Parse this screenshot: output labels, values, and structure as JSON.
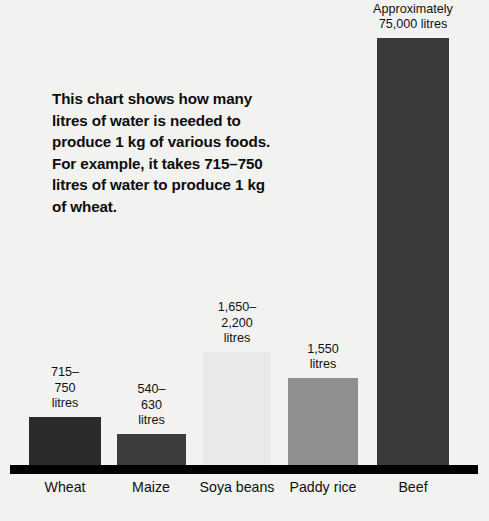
{
  "figure": {
    "background_color": "#f2f2f0",
    "axis_color": "#000000",
    "text_color": "#111111"
  },
  "caption": {
    "text": "This chart shows how many\nlitres of water is needed to\nproduce 1 kg of various foods.\nFor example, it takes 715–750\nlitres of water to produce 1 kg\nof wheat."
  },
  "chart_data": {
    "type": "bar",
    "title": "",
    "subtitle": "",
    "xlabel": "",
    "ylabel": "",
    "ylim": [
      0,
      75000
    ],
    "grid": false,
    "legend": "none",
    "units": "litres of water per 1 kg of food",
    "categories": [
      "Wheat",
      "Maize",
      "Soya beans",
      "Paddy rice",
      "Beef"
    ],
    "values": [
      732,
      585,
      1925,
      1550,
      75000
    ],
    "value_labels": [
      "715–750\nlitres",
      "540–630\nlitres",
      "1,650–\n2,200 litres",
      "1,550 litres",
      "Approximately\n75,000 litres"
    ],
    "value_ranges": [
      {
        "low": 715,
        "high": 750
      },
      {
        "low": 540,
        "high": 630
      },
      {
        "low": 1650,
        "high": 2200
      },
      {
        "low": 1550,
        "high": 1550
      },
      {
        "low": 75000,
        "high": 75000
      }
    ],
    "bar_colors": [
      "#2b2b2b",
      "#3c3c3c",
      "#e9e9e7",
      "#8f8f8f",
      "#3a3a3a"
    ],
    "bar_geometry": [
      {
        "left": 29,
        "width": 72,
        "top": 417
      },
      {
        "left": 117,
        "width": 69,
        "top": 434
      },
      {
        "left": 203,
        "width": 68,
        "top": 352
      },
      {
        "left": 288,
        "width": 70,
        "top": 378
      },
      {
        "left": 377,
        "width": 72,
        "top": 38
      }
    ],
    "category_label_centers": [
      65,
      151,
      237,
      323,
      413
    ]
  }
}
